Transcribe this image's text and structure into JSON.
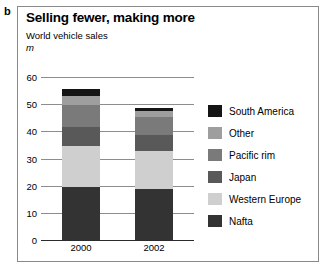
{
  "panel": {
    "label": "b"
  },
  "header": {
    "title": "Selling fewer, making more",
    "subtitle": "World vehicle sales",
    "unit": "m"
  },
  "chart_data": {
    "type": "bar",
    "subtype": "stacked-column",
    "title": "Selling fewer, making more",
    "subtitle": "World vehicle sales",
    "xlabel": "",
    "ylabel": "m",
    "ylim": [
      0,
      60
    ],
    "yticks": [
      0,
      10,
      20,
      30,
      40,
      50,
      60
    ],
    "ytick_labels": [
      "0",
      "10",
      "20",
      "30",
      "40",
      "50",
      "60"
    ],
    "grid": true,
    "legend_position": "right",
    "categories": [
      "2000",
      "2002"
    ],
    "stack_order_bottom_to_top": [
      "Nafta",
      "Western Europe",
      "Japan",
      "Pacific rim",
      "Other",
      "South America"
    ],
    "series": [
      {
        "name": "Nafta",
        "color": "#333333",
        "values": [
          20.0,
          19.0
        ]
      },
      {
        "name": "Western Europe",
        "color": "#cfcfcf",
        "values": [
          15.0,
          14.0
        ]
      },
      {
        "name": "Japan",
        "color": "#595959",
        "values": [
          7.0,
          6.0
        ]
      },
      {
        "name": "Pacific rim",
        "color": "#7a7a7a",
        "values": [
          8.0,
          6.5
        ]
      },
      {
        "name": "Other",
        "color": "#9e9e9e",
        "values": [
          3.5,
          2.5
        ]
      },
      {
        "name": "South America",
        "color": "#151515",
        "values": [
          2.5,
          1.0
        ]
      }
    ],
    "totals": [
      56.0,
      49.0
    ]
  },
  "legend": {
    "items": [
      {
        "label": "South America",
        "color": "#151515"
      },
      {
        "label": "Other",
        "color": "#9e9e9e"
      },
      {
        "label": "Pacific rim",
        "color": "#7a7a7a"
      },
      {
        "label": "Japan",
        "color": "#595959"
      },
      {
        "label": "Western Europe",
        "color": "#cfcfcf"
      },
      {
        "label": "Nafta",
        "color": "#333333"
      }
    ]
  }
}
